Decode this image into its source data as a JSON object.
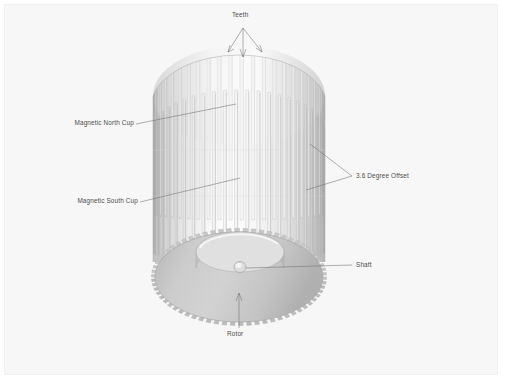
{
  "figure": {
    "background_color": "#f7f7f7",
    "page_color": "#ffffff",
    "label_color": "#4d4d4d",
    "leader_color": "#6f6f6f",
    "body_light": "#fbfbfb",
    "body_mid": "#e3e3e3",
    "body_dark": "#b9b9b9",
    "rotor_fill": "#c9c9c9",
    "rotor_edge": "#a6a6a6"
  },
  "labels": {
    "teeth": "Teeth",
    "magnetic_north_cup": "Magnetic North Cup",
    "magnetic_south_cup": "Magnetic South Cup",
    "offset": "3.6 Degree Offset",
    "shaft": "Shaft",
    "rotor": "Rotor"
  },
  "chart_data": {
    "type": "diagram",
    "callouts": [
      {
        "name": "teeth",
        "text": "Teeth",
        "anchor": "top-center",
        "leaders": 3
      },
      {
        "name": "magnetic-north-cup",
        "text": "Magnetic North Cup",
        "anchor": "upper-left",
        "leaders": 1
      },
      {
        "name": "magnetic-south-cup",
        "text": "Magnetic South Cup",
        "anchor": "lower-left",
        "leaders": 1
      },
      {
        "name": "offset",
        "text": "3.6 Degree Offset",
        "anchor": "right",
        "leaders": 2
      },
      {
        "name": "shaft",
        "text": "Shaft",
        "anchor": "center-right",
        "leaders": 1
      },
      {
        "name": "rotor",
        "text": "Rotor",
        "anchor": "bottom",
        "leaders": 1
      }
    ],
    "annotations": [
      "3.6 Degree Offset"
    ],
    "tooth_count": 48,
    "offset_degrees": 3.6
  }
}
